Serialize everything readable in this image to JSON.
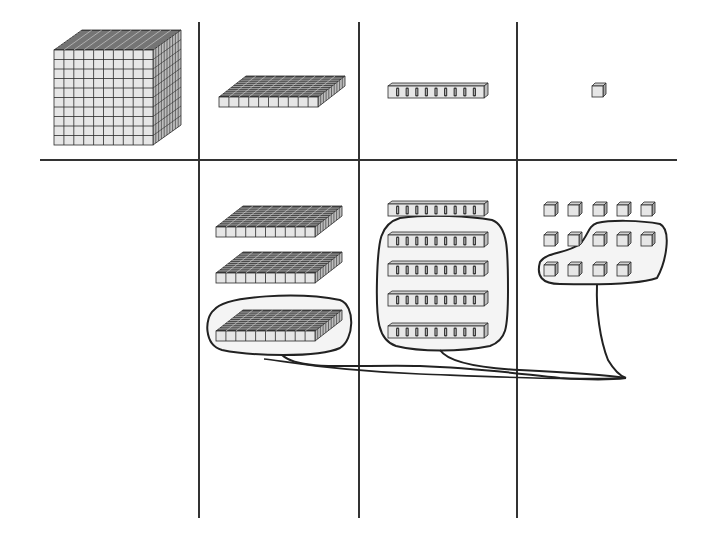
{
  "diagram": {
    "type": "base-ten-blocks place value chart",
    "colors": {
      "background": "#ffffff",
      "grid_line": "#333333",
      "block_face": "#e6e6e6",
      "block_top": "#4a4a4a",
      "block_side": "#bdbdbd",
      "block_edge": "#2a2a2a",
      "loop_fill": "#f4f4f4",
      "loop_stroke": "#222222"
    },
    "grid": {
      "vertical_lines_x": [
        199,
        359,
        517
      ],
      "vertical_span_y": [
        22,
        518
      ],
      "horizontal_line_y": 160,
      "horizontal_span_x": [
        40,
        677
      ]
    },
    "header_row": {
      "columns": [
        {
          "place": "thousands",
          "block": "cube",
          "count": 1
        },
        {
          "place": "hundreds",
          "block": "flat",
          "count": 1
        },
        {
          "place": "tens",
          "block": "rod",
          "count": 1
        },
        {
          "place": "ones",
          "block": "unit",
          "count": 1
        }
      ]
    },
    "value_row": {
      "columns": [
        {
          "place": "thousands",
          "count": 0
        },
        {
          "place": "hundreds",
          "count": 3,
          "circled": 1
        },
        {
          "place": "tens",
          "count": 5,
          "circled": 4
        },
        {
          "place": "ones",
          "count": 14,
          "rows": [
            5,
            5,
            4
          ],
          "circled": 7
        }
      ]
    },
    "connector": {
      "description": "Hand-drawn lines join the circled hundred, circled tens and circled ones to a common point",
      "join_point": [
        626,
        378
      ]
    }
  }
}
